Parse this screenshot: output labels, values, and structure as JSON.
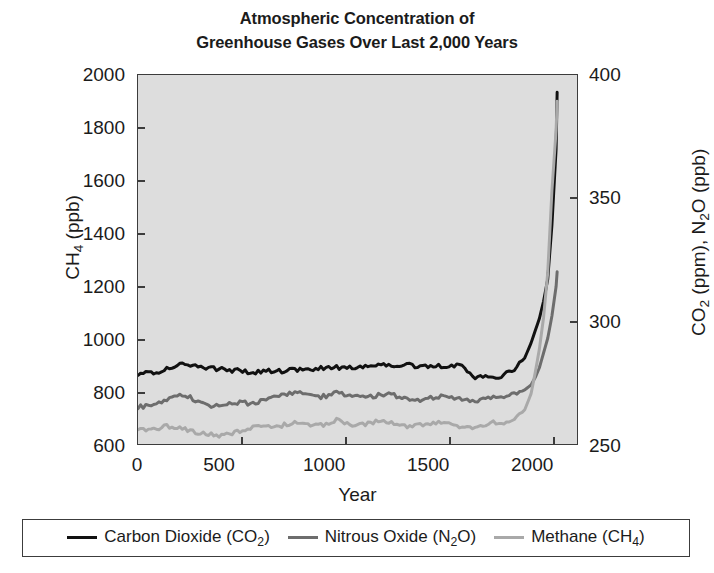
{
  "chart_data": {
    "type": "line",
    "title": "Atmospheric Concentration of Greenhouse Gases Over Last 2,000 Years",
    "title_lines": [
      "Atmospheric Concentration of",
      "Greenhouse Gases Over Last 2,000 Years"
    ],
    "xlabel": "Year",
    "ylabel_left": "CH4 (ppb)",
    "ylabel_right": "CO2 (ppm), N2O (ppb)",
    "xlim": [
      0,
      2100
    ],
    "ylim_left": [
      600,
      2000
    ],
    "ylim_right": [
      250,
      400
    ],
    "xticks": [
      0,
      500,
      1000,
      1500,
      2000
    ],
    "yticks_left": [
      600,
      800,
      1000,
      1200,
      1400,
      1600,
      1800,
      2000
    ],
    "yticks_right": [
      250,
      300,
      350,
      400
    ],
    "grid": false,
    "plot_background": "#dddddd",
    "legend_position": "below-plot",
    "series": [
      {
        "name": "Carbon Dioxide (CO2)",
        "color": "#111111",
        "axis": "right",
        "units": "ppm",
        "x": [
          0,
          50,
          100,
          150,
          200,
          250,
          300,
          350,
          400,
          450,
          500,
          550,
          600,
          650,
          700,
          750,
          800,
          850,
          900,
          950,
          1000,
          1050,
          1100,
          1150,
          1200,
          1250,
          1300,
          1350,
          1400,
          1450,
          1500,
          1550,
          1600,
          1650,
          1700,
          1750,
          1800,
          1850,
          1880,
          1900,
          1920,
          1940,
          1960,
          1980,
          2000,
          2005
        ],
        "y": [
          278.5,
          279.0,
          279.5,
          281.0,
          282.0,
          282.2,
          281.5,
          280.8,
          280.5,
          280.0,
          279.5,
          279.3,
          279.5,
          280.0,
          279.5,
          280.2,
          280.0,
          280.5,
          281.0,
          281.2,
          281.0,
          281.5,
          282.0,
          282.2,
          282.0,
          282.3,
          282.0,
          281.0,
          282.0,
          281.5,
          281.8,
          282.0,
          277.0,
          277.5,
          277.0,
          278.0,
          280.5,
          285.0,
          291.0,
          296.0,
          301.0,
          308.0,
          317.0,
          339.0,
          370.0,
          393.0
        ]
      },
      {
        "name": "Nitrous Oxide (N2O)",
        "color": "#6d6d6d",
        "axis": "right",
        "units": "ppb",
        "x": [
          0,
          50,
          100,
          150,
          200,
          250,
          300,
          350,
          400,
          450,
          500,
          550,
          600,
          650,
          700,
          750,
          800,
          850,
          900,
          950,
          1000,
          1050,
          1100,
          1150,
          1200,
          1250,
          1300,
          1350,
          1400,
          1450,
          1500,
          1550,
          1600,
          1650,
          1700,
          1750,
          1800,
          1850,
          1880,
          1900,
          1920,
          1940,
          1960,
          1980,
          2000,
          2005
        ],
        "y": [
          265.0,
          265.5,
          266.5,
          268.0,
          269.5,
          269.0,
          267.0,
          265.5,
          265.8,
          266.5,
          266.8,
          266.5,
          267.5,
          269.0,
          270.5,
          271.0,
          270.0,
          269.0,
          269.5,
          271.0,
          270.0,
          269.5,
          269.0,
          269.8,
          270.0,
          269.5,
          268.5,
          267.5,
          268.5,
          269.5,
          268.5,
          268.0,
          267.0,
          268.5,
          269.5,
          269.0,
          270.0,
          272.0,
          274.0,
          277.0,
          281.0,
          287.0,
          293.0,
          302.0,
          314.0,
          320.0
        ]
      },
      {
        "name": "Methane (CH4)",
        "color": "#a9a9a9",
        "axis": "left",
        "units": "ppb",
        "x": [
          0,
          50,
          100,
          150,
          200,
          250,
          300,
          350,
          400,
          450,
          500,
          550,
          600,
          650,
          700,
          750,
          800,
          850,
          900,
          950,
          1000,
          1050,
          1100,
          1150,
          1200,
          1250,
          1300,
          1350,
          1400,
          1450,
          1500,
          1550,
          1600,
          1650,
          1700,
          1750,
          1800,
          1850,
          1880,
          1900,
          1920,
          1940,
          1960,
          1980,
          2000,
          2005
        ],
        "y": [
          650,
          655,
          662,
          668,
          662,
          650,
          640,
          636,
          632,
          640,
          655,
          662,
          668,
          662,
          672,
          682,
          676,
          668,
          675,
          690,
          682,
          668,
          676,
          686,
          682,
          670,
          666,
          672,
          680,
          686,
          678,
          666,
          660,
          672,
          684,
          676,
          690,
          730,
          790,
          870,
          960,
          1080,
          1250,
          1560,
          1790,
          1900
        ]
      }
    ]
  },
  "axes": {
    "left_title": "CH",
    "left_sub": "4",
    "left_unit": " (ppb)",
    "right_title_a": "CO",
    "right_sub_a": "2",
    "right_mid": " (ppm), N",
    "right_sub_b": "2",
    "right_tail": "O (ppb)"
  },
  "legend": {
    "entries": [
      {
        "label_main": "Carbon Dioxide (CO",
        "sub": "2",
        "tail": ")",
        "swatch": "co2-line-swatch"
      },
      {
        "label_main": "Nitrous Oxide (N",
        "sub": "2",
        "tail": "O)",
        "swatch": "n2o-line-swatch"
      },
      {
        "label_main": "Methane (CH",
        "sub": "4",
        "tail": ")",
        "swatch": "ch4-line-swatch"
      }
    ]
  }
}
